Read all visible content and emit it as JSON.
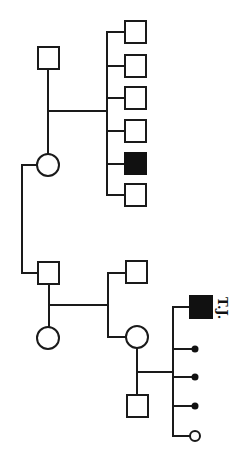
{
  "diagram": {
    "type": "pedigree",
    "orientation": "rotated (generations run left-to-right)",
    "colors": {
      "line": "#1a1a1a",
      "affected": "#111111",
      "unaffected": "#ffffff"
    },
    "individuals": [
      {
        "id": "I-1",
        "sex": "male",
        "affected": false,
        "generation": 1
      },
      {
        "id": "I-2",
        "sex": "female",
        "affected": false,
        "generation": 1
      },
      {
        "id": "II-1",
        "sex": "male",
        "affected": false,
        "generation": 2
      },
      {
        "id": "II-2",
        "sex": "male",
        "affected": false,
        "generation": 2
      },
      {
        "id": "II-3",
        "sex": "male",
        "affected": false,
        "generation": 2
      },
      {
        "id": "II-4",
        "sex": "male",
        "affected": false,
        "generation": 2
      },
      {
        "id": "II-5",
        "sex": "male",
        "affected": true,
        "generation": 2
      },
      {
        "id": "II-6",
        "sex": "male",
        "affected": false,
        "generation": 2
      },
      {
        "id": "II-7",
        "sex": "male",
        "affected": false,
        "generation": 2,
        "note": "spouse of II-8"
      },
      {
        "id": "II-8",
        "sex": "female",
        "affected": false,
        "generation": 2,
        "note": "daughter of I-2"
      },
      {
        "id": "III-1",
        "sex": "male",
        "affected": false,
        "generation": 3
      },
      {
        "id": "III-2",
        "sex": "female",
        "affected": false,
        "generation": 3
      },
      {
        "id": "III-3",
        "sex": "male",
        "affected": false,
        "generation": 3,
        "note": "spouse of III-2"
      },
      {
        "id": "IV-1",
        "sex": "male",
        "affected": true,
        "generation": 4,
        "label": "T.J."
      },
      {
        "id": "IV-2",
        "sex": "unknown",
        "affected": false,
        "generation": 4,
        "type": "miscarriage/small"
      },
      {
        "id": "IV-3",
        "sex": "unknown",
        "affected": false,
        "generation": 4,
        "type": "miscarriage/small"
      },
      {
        "id": "IV-4",
        "sex": "unknown",
        "affected": false,
        "generation": 4,
        "type": "miscarriage/small"
      },
      {
        "id": "IV-5",
        "sex": "female",
        "affected": false,
        "generation": 4,
        "type": "small"
      }
    ],
    "proband_label": "T.J."
  }
}
